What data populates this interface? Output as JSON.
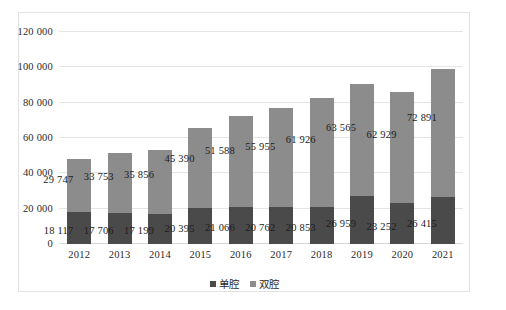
{
  "chart_data": {
    "type": "bar",
    "stacked": true,
    "title": "",
    "xlabel": "",
    "ylabel": "",
    "ylim": [
      0,
      120000
    ],
    "ytick_step": 20000,
    "ytick_labels": [
      "0",
      "20 000",
      "40 000",
      "60 000",
      "80 000",
      "100 000",
      "120 000"
    ],
    "ytick_values": [
      0,
      20000,
      40000,
      60000,
      80000,
      100000,
      120000
    ],
    "grid": "horizontal",
    "legend_position": "bottom-center",
    "categories": [
      "2012",
      "2013",
      "2014",
      "2015",
      "2016",
      "2017",
      "2018",
      "2019",
      "2020",
      "2021"
    ],
    "series": [
      {
        "name": "单腔",
        "color": "#4a4a4a",
        "values": [
          18117,
          17706,
          17199,
          20395,
          21066,
          20762,
          20853,
          26959,
          23252,
          26415
        ],
        "labels": [
          "18 117",
          "17 706",
          "17 199",
          "20 395",
          "21 066",
          "20 762",
          "20 853",
          "26 959",
          "23 252",
          "26 415"
        ]
      },
      {
        "name": "双腔",
        "color": "#8c8c8c",
        "values": [
          29747,
          33753,
          35856,
          45390,
          51588,
          55955,
          61926,
          63565,
          62929,
          72891
        ],
        "labels": [
          "29 747",
          "33 753",
          "35 856",
          "45 390",
          "51 588",
          "55 955",
          "61 926",
          "63 565",
          "62 929",
          "72 891"
        ]
      }
    ],
    "totals": [
      47864,
      51459,
      53055,
      65785,
      72654,
      76717,
      82779,
      90524,
      86181,
      99306
    ]
  },
  "legend": {
    "items": [
      {
        "label": "单腔",
        "color": "#4a4a4a"
      },
      {
        "label": "双腔",
        "color": "#8c8c8c"
      }
    ]
  },
  "caption": {
    "text": ""
  }
}
